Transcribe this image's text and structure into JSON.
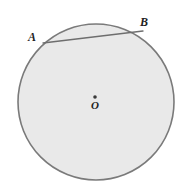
{
  "figure": {
    "kind": "geometry-diagram",
    "background_color": "#ffffff",
    "canvas": {
      "width": 184,
      "height": 193
    }
  },
  "circle": {
    "name": "circle-O",
    "center": {
      "x": 96,
      "y": 102
    },
    "radius": 78,
    "fill_color": "#e9e9e9",
    "stroke_color": "#7a7a7a",
    "stroke_width": 1.6
  },
  "center_dot": {
    "name": "center-point",
    "x": 95,
    "y": 97,
    "radius": 1.8,
    "color": "#3a3a3a"
  },
  "chord": {
    "name": "chord-AB",
    "from": {
      "x": 43,
      "y": 43
    },
    "to": {
      "x": 143,
      "y": 31
    },
    "stroke_color": "#6e6e6e",
    "stroke_width": 1.3
  },
  "labels": {
    "a": "A",
    "b": "B",
    "o": "O"
  }
}
